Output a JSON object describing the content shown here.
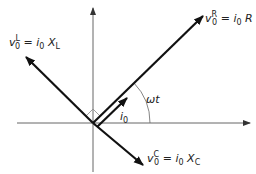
{
  "diagram": {
    "colors": {
      "axis": "#555555",
      "phasor": "#111111",
      "text": "#222222"
    },
    "axes": {
      "origin": [
        93,
        123
      ],
      "horizontal": {
        "from": [
          17,
          123
        ],
        "to": [
          250,
          123
        ]
      },
      "vertical": {
        "from": [
          93,
          172
        ],
        "to": [
          93,
          8
        ]
      }
    },
    "phasors": [
      {
        "id": "vR",
        "from": [
          93,
          123
        ],
        "to": [
          203,
          16
        ],
        "label": {
          "base": "v",
          "sup": "R",
          "sub": "0",
          "eq": " = ",
          "rhs_i": "i",
          "rhs_sub": "0",
          "rhs_tail": " R",
          "x": 205,
          "y": 22
        }
      },
      {
        "id": "vL",
        "from": [
          93,
          123
        ],
        "to": [
          26,
          57
        ],
        "label": {
          "base": "v",
          "sup": "L",
          "sub": "0",
          "eq": " = ",
          "rhs_i": "i",
          "rhs_sub": "0",
          "rhs_tail": " X",
          "rhs_tail_sub": "L",
          "x": 9,
          "y": 46
        }
      },
      {
        "id": "vC",
        "from": [
          93,
          123
        ],
        "to": [
          143,
          165
        ],
        "label": {
          "base": "v",
          "sup": "C",
          "sub": "0",
          "eq": " = ",
          "rhs_i": "i",
          "rhs_sub": "0",
          "rhs_tail": " X",
          "rhs_tail_sub": "C",
          "x": 147,
          "y": 162
        }
      },
      {
        "id": "i0",
        "from": [
          97,
          127
        ],
        "to": [
          127,
          98
        ],
        "label": {
          "base": "i",
          "sub": "0",
          "x": 120,
          "y": 120
        }
      }
    ],
    "angle": {
      "label": "ωt",
      "x": 146,
      "y": 103
    },
    "right_angle_mark": true
  }
}
